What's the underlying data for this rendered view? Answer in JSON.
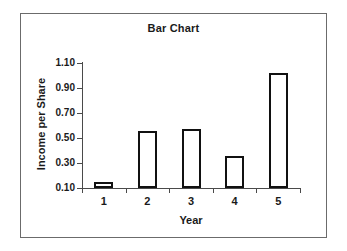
{
  "chart_data": {
    "type": "bar",
    "title": "Bar Chart",
    "xlabel": "Year",
    "ylabel": "Income per Share",
    "categories": [
      "1",
      "2",
      "3",
      "4",
      "5"
    ],
    "values": [
      0.145,
      0.56,
      0.57,
      0.36,
      1.02
    ],
    "ylim": [
      0.1,
      1.1
    ],
    "ytick_labels": [
      "1.10",
      "0.90",
      "0.70",
      "0.50",
      "0.30",
      "0.10"
    ],
    "ytick_values": [
      1.1,
      0.9,
      0.7,
      0.5,
      0.3,
      0.1
    ],
    "grid": false,
    "legend": null,
    "bar_style": {
      "fill": "#ffffff",
      "edge_color": "#111111",
      "edge_width": 2
    },
    "axis_color": "#4a4a4a",
    "frame_color": "#6b6b6b",
    "text_color": "#1a1a1a"
  }
}
